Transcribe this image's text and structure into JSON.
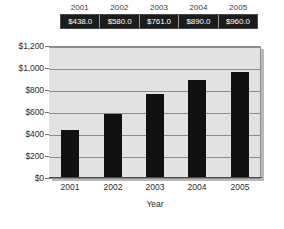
{
  "chart_data": {
    "type": "bar",
    "title": "",
    "xlabel": "Year",
    "ylabel": "",
    "categories": [
      "2001",
      "2002",
      "2003",
      "2004",
      "2005"
    ],
    "values": [
      438.0,
      580.0,
      761.0,
      890.0,
      960.0
    ],
    "value_labels": [
      "$438.0",
      "$580.0",
      "$761.0",
      "$890.0",
      "$960.0"
    ],
    "ylim": [
      0,
      1200
    ],
    "ytick_values": [
      1200,
      1000,
      800,
      600,
      400,
      200,
      0
    ],
    "ytick_labels": [
      "$1,200",
      "$1,000",
      "$800",
      "$600",
      "$400",
      "$200",
      "$0"
    ],
    "grid": true,
    "legend": "none",
    "colors": {
      "bar": "#111111",
      "plot_background": "#e2e2e2",
      "gridline": "#8c8c8c",
      "table_cell_background": "#1c1c1c",
      "table_cell_text": "#ffffff",
      "axis_text": "#2b2b2b"
    }
  },
  "data_table": {
    "header": [
      "2001",
      "2002",
      "2003",
      "2004",
      "2005"
    ],
    "values": [
      "$438.0",
      "$580.0",
      "$761.0",
      "$890.0",
      "$960.0"
    ]
  },
  "axes": {
    "x_title": "Year",
    "y_ticks": [
      "$1,200",
      "$1,000",
      "$800",
      "$600",
      "$400",
      "$200",
      "$0"
    ],
    "x_ticks": [
      "2001",
      "2002",
      "2003",
      "2004",
      "2005"
    ]
  }
}
